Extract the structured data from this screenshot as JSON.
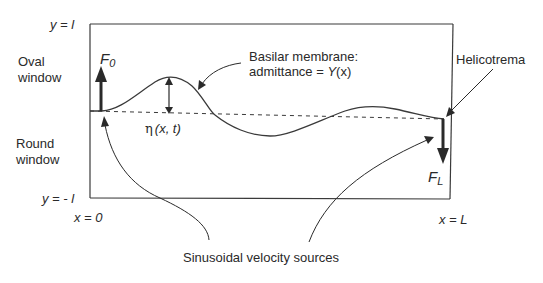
{
  "diagram": {
    "type": "cochlea-transmission-line-model",
    "colors": {
      "line": "#3a3a3a",
      "text": "#2a2a2a",
      "background": "#ffffff"
    },
    "labels": {
      "top_boundary": "y = l",
      "bottom_boundary": "y = - l",
      "x_start": "x = 0",
      "x_end": "x = L",
      "oval_window_line1": "Oval",
      "oval_window_line2": "window",
      "round_window_line1": "Round",
      "round_window_line2": "window",
      "force_left": "F",
      "force_left_sub": "0",
      "force_right": "F",
      "force_right_sub": "L",
      "basilar_line1": "Basilar membrane:",
      "basilar_line2_prefix": "admittance = ",
      "basilar_line2_func": "Y",
      "basilar_line2_arg": "(x)",
      "displacement_symbol": "η",
      "displacement_args": "(x, t)",
      "helicotrema": "Helicotrema",
      "sources": "Sinusoidal velocity sources"
    }
  }
}
